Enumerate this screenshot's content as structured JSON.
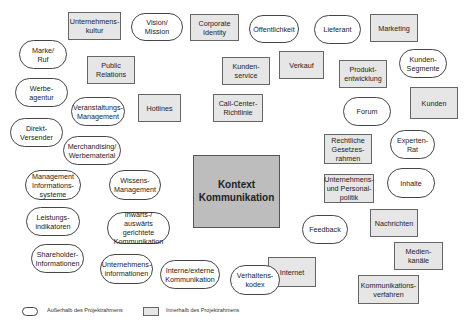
{
  "diagram": {
    "center": "Kontext\nKommunikation",
    "inside_project": [
      "Unternehmens-\nkultur",
      "Corporate\nIdentity",
      "Marketing",
      "Public\nRelations",
      "Kunden-\nservice",
      "Verkauf",
      "Produkt-\nentwicklung",
      "Kunden",
      "Hotlines",
      "Call-Center-\nRichtlinie",
      "Rechtliche\nGesetzes-\nrahmen",
      "Unternehmens-\nund Personal-\npolitik",
      "Nachrichten",
      "Medien-\nkanäle",
      "Internet",
      "Kommunikations-\nverfahren"
    ],
    "outside_project": [
      "Vision/\nMission",
      "Öffentlichkeit",
      "Lieferant",
      "Marke/\nRuf",
      "Kunden-\nSegmente",
      "Werbe-\nagentur",
      "Veranstaltungs-\nManagement",
      "Forum",
      "Direkt-\nVersender",
      "Experten-\nRat",
      "Merchandising/\nWerbematerial",
      "Management\nInformations-\nsysteme",
      "Wissens-\nManagement",
      "Inhalte",
      "Leistungs-\nindikatoren",
      "Inwärts-/\nauswärts gerichtete\nKommunikation",
      "Feedback",
      "Shareholder-\nInformationen",
      "Unternehmens-\ninformationen",
      "Interne/externe\nKommunikation",
      "Verhaltens-\nkodex"
    ]
  },
  "legend": {
    "outside_label": "Außerhalb des Projektrahmens",
    "inside_label": "Innerhalb des Projektrahmens"
  },
  "colors": {
    "box_fill": "#e6e6e6",
    "center_fill": "#bdbdbd",
    "oval_fill": "#ffffff",
    "stroke": "#444444"
  }
}
